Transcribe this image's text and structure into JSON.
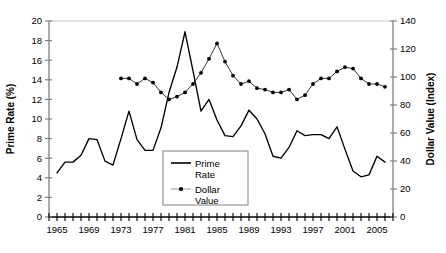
{
  "chart_data": {
    "type": "line",
    "title": "",
    "subtitle": "",
    "xlabel": "",
    "ylabel": "Prime Rate (%)",
    "y2label": "Dollar Value (Index)",
    "xlim": [
      1964,
      2007
    ],
    "ylim": [
      0,
      20
    ],
    "y2lim": [
      0,
      140
    ],
    "ytick_step": 2,
    "y2tick_step": 20,
    "xtick_step": 1,
    "xlabel_step": 4,
    "grid": false,
    "legend_position": "center-bottom-inside",
    "x_ticks": [
      1964,
      1965,
      1966,
      1967,
      1968,
      1969,
      1970,
      1971,
      1972,
      1973,
      1974,
      1975,
      1976,
      1977,
      1978,
      1979,
      1980,
      1981,
      1982,
      1983,
      1984,
      1985,
      1986,
      1987,
      1988,
      1989,
      1990,
      1991,
      1992,
      1993,
      1994,
      1995,
      1996,
      1997,
      1998,
      1999,
      2000,
      2001,
      2002,
      2003,
      2004,
      2005,
      2006,
      2007
    ],
    "x_tick_labels": [
      "1965",
      "1969",
      "1973",
      "1977",
      "1981",
      "1985",
      "1989",
      "1993",
      "1997",
      "2001",
      "2005"
    ],
    "x_tick_label_years": [
      1965,
      1969,
      1973,
      1977,
      1981,
      1985,
      1989,
      1993,
      1997,
      2001,
      2005
    ],
    "y_tick_labels": [
      "0",
      "2",
      "4",
      "6",
      "8",
      "10",
      "12",
      "14",
      "16",
      "18",
      "20"
    ],
    "y2_tick_labels": [
      "0",
      "20",
      "40",
      "60",
      "80",
      "100",
      "120",
      "140"
    ],
    "series": [
      {
        "name": "Prime Rate",
        "axis": "left",
        "marker": "none",
        "color": "#000000",
        "x": [
          1965,
          1966,
          1967,
          1968,
          1969,
          1970,
          1971,
          1972,
          1973,
          1974,
          1975,
          1976,
          1977,
          1978,
          1979,
          1980,
          1981,
          1982,
          1983,
          1984,
          1985,
          1986,
          1987,
          1988,
          1989,
          1990,
          1991,
          1992,
          1993,
          1994,
          1995,
          1996,
          1997,
          1998,
          1999,
          2000,
          2001,
          2002,
          2003,
          2004,
          2005,
          2006
        ],
        "values": [
          4.5,
          5.6,
          5.6,
          6.3,
          8.0,
          7.9,
          5.7,
          5.3,
          8.0,
          10.8,
          7.9,
          6.8,
          6.8,
          9.1,
          12.7,
          15.3,
          18.9,
          14.9,
          10.8,
          12.0,
          9.9,
          8.3,
          8.2,
          9.3,
          10.9,
          10.0,
          8.5,
          6.2,
          6.0,
          7.1,
          8.8,
          8.3,
          8.4,
          8.4,
          8.0,
          9.2,
          6.9,
          4.7,
          4.1,
          4.3,
          6.2,
          5.6
        ]
      },
      {
        "name": "Dollar Value",
        "axis": "right",
        "marker": "dot",
        "color": "#000000",
        "x": [
          1973,
          1974,
          1975,
          1976,
          1977,
          1978,
          1979,
          1980,
          1981,
          1982,
          1983,
          1984,
          1985,
          1986,
          1987,
          1988,
          1989,
          1990,
          1991,
          1992,
          1993,
          1994,
          1995,
          1996,
          1997,
          1998,
          1999,
          2000,
          2001,
          2002,
          2003,
          2004,
          2005,
          2006
        ],
        "values": [
          99,
          99,
          95,
          99,
          96,
          89,
          84,
          86,
          89,
          95,
          103,
          113,
          124,
          111,
          101,
          95,
          97,
          92,
          91,
          89,
          89,
          91,
          84,
          87,
          95,
          99,
          99,
          104,
          107,
          106,
          99,
          95,
          95,
          93
        ]
      }
    ]
  },
  "axes": {
    "left_title": "Prime Rate (%)",
    "right_title": "Dollar Value (Index)"
  },
  "legend": {
    "items": [
      {
        "label_line1": "Prime",
        "label_line2": "Rate",
        "marker": "line"
      },
      {
        "label_line1": "Dollar",
        "label_line2": "Value",
        "marker": "line-dot"
      }
    ]
  }
}
